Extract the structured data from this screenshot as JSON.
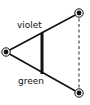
{
  "diagram": {
    "labels": {
      "top_edge": "violet",
      "bottom_edge": "green"
    },
    "nodes": [
      {
        "id": "left",
        "x": 6,
        "y": 52
      },
      {
        "id": "top-right",
        "x": 79,
        "y": 13
      },
      {
        "id": "bottom-right",
        "x": 79,
        "y": 93
      }
    ],
    "edges": [
      {
        "from": "left",
        "to": "top-right",
        "style": "solid",
        "label": "violet"
      },
      {
        "from": "left",
        "to": "bottom-right",
        "style": "solid",
        "label": "green"
      },
      {
        "from": "top-right",
        "to": "bottom-right",
        "style": "dashed"
      }
    ],
    "crossbar": {
      "x": 42,
      "y1": 34,
      "y2": 73,
      "style": "thick"
    },
    "colors": {
      "stroke": "#111111",
      "background": "#ffffff"
    }
  }
}
